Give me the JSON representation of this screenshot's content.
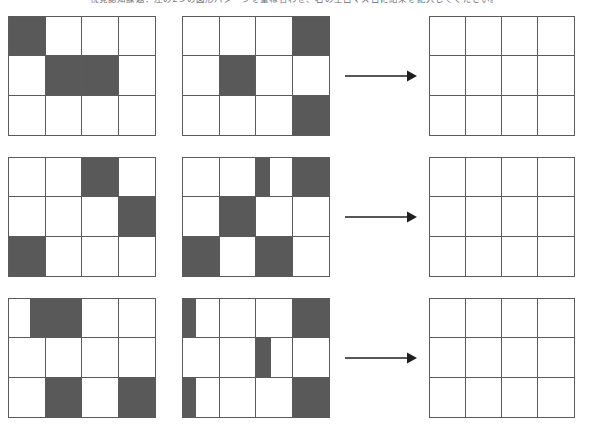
{
  "page": {
    "instruction": "視覚認知課題：左の2つの図形パターンを重ね合わせ、右の空白マス目に結果を記入してください。",
    "background_color": "#ffffff",
    "grid_line_color": "#5b5b5b",
    "fill_color": "#595959",
    "arrow_color": "#1f1f1f",
    "grid_columns": 4,
    "grid_rows": 3
  },
  "arrow": {
    "icon": "right-arrow-icon",
    "label": "→"
  },
  "puzzles": [
    {
      "index": 1,
      "grids": [
        {
          "role": "operand-a",
          "name": "row-1-grid-a",
          "cells": [
            [
              {
                "fill": "full"
              },
              {
                "fill": "none"
              },
              {
                "fill": "none"
              },
              {
                "fill": "none"
              }
            ],
            [
              {
                "fill": "none"
              },
              {
                "fill": "full"
              },
              {
                "fill": "full"
              },
              {
                "fill": "none"
              }
            ],
            [
              {
                "fill": "none"
              },
              {
                "fill": "none"
              },
              {
                "fill": "none"
              },
              {
                "fill": "none"
              }
            ]
          ]
        },
        {
          "role": "operand-b",
          "name": "row-1-grid-b",
          "cells": [
            [
              {
                "fill": "none"
              },
              {
                "fill": "none"
              },
              {
                "fill": "none"
              },
              {
                "fill": "full"
              }
            ],
            [
              {
                "fill": "none"
              },
              {
                "fill": "full"
              },
              {
                "fill": "none"
              },
              {
                "fill": "none"
              }
            ],
            [
              {
                "fill": "none"
              },
              {
                "fill": "none"
              },
              {
                "fill": "none"
              },
              {
                "fill": "full"
              }
            ]
          ]
        },
        {
          "role": "answer",
          "name": "row-1-grid-answer",
          "cells": [
            [
              {
                "fill": "none"
              },
              {
                "fill": "none"
              },
              {
                "fill": "none"
              },
              {
                "fill": "none"
              }
            ],
            [
              {
                "fill": "none"
              },
              {
                "fill": "none"
              },
              {
                "fill": "none"
              },
              {
                "fill": "none"
              }
            ],
            [
              {
                "fill": "none"
              },
              {
                "fill": "none"
              },
              {
                "fill": "none"
              },
              {
                "fill": "none"
              }
            ]
          ]
        }
      ]
    },
    {
      "index": 2,
      "grids": [
        {
          "role": "operand-a",
          "name": "row-2-grid-a",
          "cells": [
            [
              {
                "fill": "none"
              },
              {
                "fill": "none"
              },
              {
                "fill": "full"
              },
              {
                "fill": "none"
              }
            ],
            [
              {
                "fill": "none"
              },
              {
                "fill": "none"
              },
              {
                "fill": "none"
              },
              {
                "fill": "full"
              }
            ],
            [
              {
                "fill": "full"
              },
              {
                "fill": "none"
              },
              {
                "fill": "none"
              },
              {
                "fill": "none"
              }
            ]
          ]
        },
        {
          "role": "operand-b",
          "name": "row-2-grid-b",
          "cells": [
            [
              {
                "fill": "none"
              },
              {
                "fill": "none"
              },
              {
                "fill": "left",
                "width_pct": 42
              },
              {
                "fill": "full"
              }
            ],
            [
              {
                "fill": "none"
              },
              {
                "fill": "full"
              },
              {
                "fill": "none"
              },
              {
                "fill": "none"
              }
            ],
            [
              {
                "fill": "full"
              },
              {
                "fill": "none"
              },
              {
                "fill": "full"
              },
              {
                "fill": "none"
              }
            ]
          ]
        },
        {
          "role": "answer",
          "name": "row-2-grid-answer",
          "cells": [
            [
              {
                "fill": "none"
              },
              {
                "fill": "none"
              },
              {
                "fill": "none"
              },
              {
                "fill": "none"
              }
            ],
            [
              {
                "fill": "none"
              },
              {
                "fill": "none"
              },
              {
                "fill": "none"
              },
              {
                "fill": "none"
              }
            ],
            [
              {
                "fill": "none"
              },
              {
                "fill": "none"
              },
              {
                "fill": "none"
              },
              {
                "fill": "none"
              }
            ]
          ]
        }
      ]
    },
    {
      "index": 3,
      "grids": [
        {
          "role": "operand-a",
          "name": "row-3-grid-a",
          "cells": [
            [
              {
                "fill": "right",
                "width_pct": 45
              },
              {
                "fill": "full"
              },
              {
                "fill": "none"
              },
              {
                "fill": "none"
              }
            ],
            [
              {
                "fill": "none"
              },
              {
                "fill": "none"
              },
              {
                "fill": "none"
              },
              {
                "fill": "none"
              }
            ],
            [
              {
                "fill": "none"
              },
              {
                "fill": "full"
              },
              {
                "fill": "none"
              },
              {
                "fill": "full"
              }
            ]
          ]
        },
        {
          "role": "operand-b",
          "name": "row-3-grid-b",
          "cells": [
            [
              {
                "fill": "left",
                "width_pct": 40
              },
              {
                "fill": "none"
              },
              {
                "fill": "none"
              },
              {
                "fill": "full"
              }
            ],
            [
              {
                "fill": "none"
              },
              {
                "fill": "none"
              },
              {
                "fill": "left",
                "width_pct": 45
              },
              {
                "fill": "none"
              }
            ],
            [
              {
                "fill": "left",
                "width_pct": 40
              },
              {
                "fill": "none"
              },
              {
                "fill": "none"
              },
              {
                "fill": "full"
              }
            ]
          ]
        },
        {
          "role": "answer",
          "name": "row-3-grid-answer",
          "cells": [
            [
              {
                "fill": "none"
              },
              {
                "fill": "none"
              },
              {
                "fill": "none"
              },
              {
                "fill": "none"
              }
            ],
            [
              {
                "fill": "none"
              },
              {
                "fill": "none"
              },
              {
                "fill": "none"
              },
              {
                "fill": "none"
              }
            ],
            [
              {
                "fill": "none"
              },
              {
                "fill": "none"
              },
              {
                "fill": "none"
              },
              {
                "fill": "none"
              }
            ]
          ]
        }
      ]
    }
  ]
}
